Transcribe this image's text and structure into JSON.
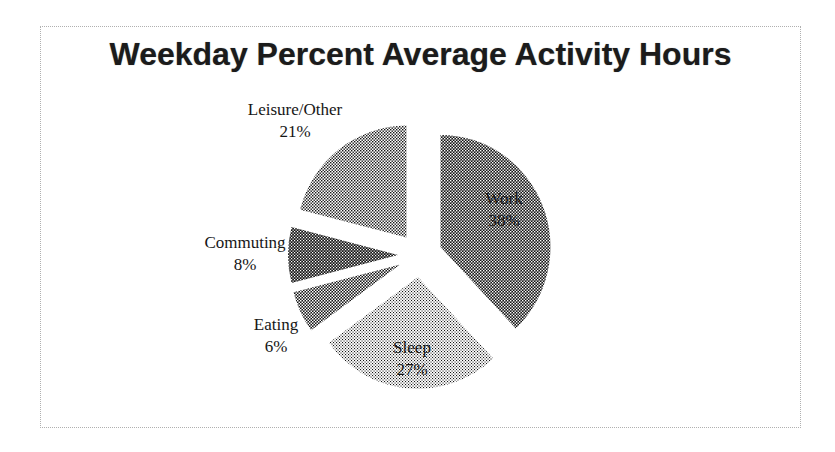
{
  "frame": {
    "background": "#ffffff",
    "border_color": "#b0b0b0",
    "border_style": "dotted"
  },
  "chart_data": {
    "type": "pie",
    "title": "Weekday Percent Average Activity Hours",
    "exploded": true,
    "start_angle_deg": 0,
    "direction": "clockwise",
    "legend": "none",
    "palette_style": "grayscale-halftone",
    "slices": [
      {
        "label": "Work",
        "value": 38,
        "pct_text": "38%",
        "fill": "#6e6e6e",
        "label_inside": true
      },
      {
        "label": "Sleep",
        "value": 27,
        "pct_text": "27%",
        "fill": "#bdbdbd",
        "label_inside": true
      },
      {
        "label": "Eating",
        "value": 6,
        "pct_text": "6%",
        "fill": "#7d7d7d",
        "label_inside": false
      },
      {
        "label": "Commuting",
        "value": 8,
        "pct_text": "8%",
        "fill": "#585858",
        "label_inside": false
      },
      {
        "label": "Leisure/Other",
        "value": 21,
        "pct_text": "21%",
        "fill": "#8f8f8f",
        "label_inside": false
      }
    ]
  }
}
